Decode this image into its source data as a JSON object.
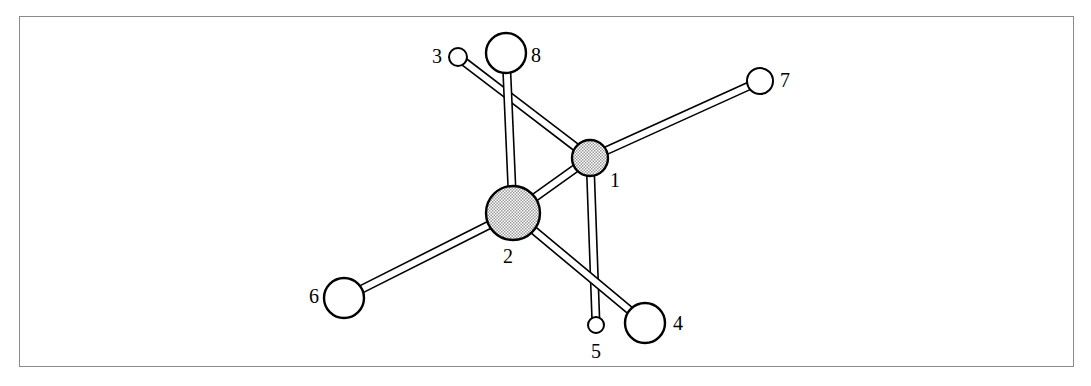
{
  "figure": {
    "kind": "ball-and-stick molecular structure diagram",
    "frame": {
      "x": 19,
      "y": 16,
      "width": 1055,
      "height": 351,
      "border_color": "#8a8a8a",
      "border_width": 1.6
    },
    "background_color": "#ffffff",
    "bond_style": {
      "fill": "#ffffff",
      "stroke": "#000000",
      "stroke_width": 1.6,
      "tube_width": 6
    },
    "shaded_atom_fill": "#d8d8d8",
    "open_atom_fill": "#ffffff",
    "atom_stroke": "#000000"
  },
  "atoms": [
    {
      "id": "1",
      "label": "1",
      "cx": 590,
      "cy": 158,
      "r": 18,
      "style": "shaded",
      "label_x": 615,
      "label_y": 182
    },
    {
      "id": "2",
      "label": "2",
      "cx": 513,
      "cy": 213,
      "r": 27,
      "style": "shaded",
      "label_x": 508,
      "label_y": 258
    },
    {
      "id": "3",
      "label": "3",
      "cx": 458,
      "cy": 57,
      "r": 9,
      "style": "open",
      "label_x": 437,
      "label_y": 58
    },
    {
      "id": "4",
      "label": "4",
      "cx": 645,
      "cy": 323,
      "r": 20,
      "style": "open",
      "label_x": 678,
      "label_y": 325
    },
    {
      "id": "5",
      "label": "5",
      "cx": 596,
      "cy": 325,
      "r": 8,
      "style": "open",
      "label_x": 596,
      "label_y": 353
    },
    {
      "id": "6",
      "label": "6",
      "cx": 344,
      "cy": 298,
      "r": 20,
      "style": "open",
      "label_x": 314,
      "label_y": 298
    },
    {
      "id": "7",
      "label": "7",
      "cx": 760,
      "cy": 81,
      "r": 13,
      "style": "open",
      "label_x": 785,
      "label_y": 82
    },
    {
      "id": "8",
      "label": "8",
      "cx": 506,
      "cy": 53,
      "r": 20,
      "style": "open",
      "label_x": 536,
      "label_y": 57
    }
  ],
  "bonds": [
    {
      "from": "1",
      "to": "3",
      "order": 1
    },
    {
      "from": "1",
      "to": "7",
      "order": 1
    },
    {
      "from": "1",
      "to": "5",
      "order": 1
    },
    {
      "from": "1",
      "to": "2",
      "order": 1
    },
    {
      "from": "2",
      "to": "8",
      "order": 1
    },
    {
      "from": "2",
      "to": "6",
      "order": 1
    },
    {
      "from": "2",
      "to": "4",
      "order": 1
    }
  ]
}
